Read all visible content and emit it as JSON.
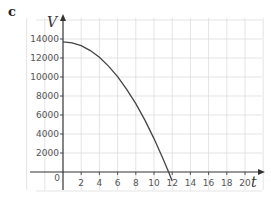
{
  "part_label": "c",
  "chart_data": {
    "type": "line",
    "title": "",
    "xlabel": "t",
    "ylabel": "V",
    "x_ticks": [
      2,
      4,
      6,
      8,
      10,
      12,
      14,
      16,
      18,
      20
    ],
    "y_ticks": [
      2000,
      4000,
      6000,
      8000,
      10000,
      12000,
      14000
    ],
    "origin_label": "0",
    "xlim": [
      -5,
      21
    ],
    "ylim": [
      -2000,
      15000
    ],
    "grid": true,
    "series": [
      {
        "name": "V",
        "x": [
          0,
          1,
          2,
          3,
          4,
          5,
          6,
          7,
          8,
          9,
          10,
          11,
          11.6,
          12
        ],
        "values": [
          13700,
          13600,
          13290,
          12780,
          12070,
          11150,
          10030,
          8710,
          7190,
          5460,
          3520,
          1380,
          0,
          -960
        ]
      }
    ],
    "colors": {
      "curve": "#444444",
      "axis": "#333333",
      "grid": "#d8d8d8"
    }
  }
}
